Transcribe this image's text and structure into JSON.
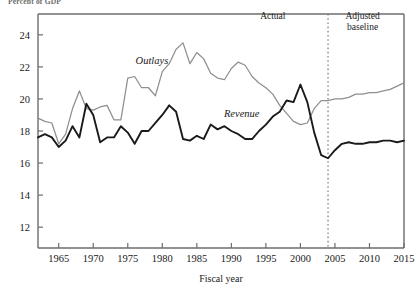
{
  "figure": {
    "supertitle": "Percent of GDP"
  },
  "chart_data": {
    "type": "line",
    "title": "Percent of GDP",
    "xlabel": "Fiscal year",
    "ylabel": "",
    "xlim": [
      1962,
      2015
    ],
    "ylim": [
      10.7,
      25.3
    ],
    "grid": false,
    "legend_position": "inline-annotation",
    "xticks": [
      1965,
      1970,
      1975,
      1980,
      1985,
      1990,
      1995,
      2000,
      2005,
      2010,
      2015
    ],
    "yticks": [
      12,
      14,
      16,
      18,
      20,
      22,
      24
    ],
    "annotations": [
      {
        "name": "actual-label",
        "text": "Actual",
        "x": 1996,
        "y": 25.0
      },
      {
        "name": "adjusted-baseline-label",
        "text": "Adjusted baseline",
        "x": 2009,
        "y": 25.0
      },
      {
        "name": "outlays-inline-label",
        "text": "Outlays",
        "x": 1978.5,
        "y": 22.2
      },
      {
        "name": "revenue-inline-label",
        "text": "Revenue",
        "x": 1991.5,
        "y": 18.9
      }
    ],
    "divider": {
      "name": "projection-divider",
      "x": 2004,
      "style": "dotted"
    },
    "colors": {
      "outlays": "#8f8f8f",
      "revenue": "#1a1a1a",
      "axis": "#6d6d6d",
      "divider": "#7a7a7a"
    },
    "x": [
      1962,
      1963,
      1964,
      1965,
      1966,
      1967,
      1968,
      1969,
      1970,
      1971,
      1972,
      1973,
      1974,
      1975,
      1976,
      1977,
      1978,
      1979,
      1980,
      1981,
      1982,
      1983,
      1984,
      1985,
      1986,
      1987,
      1988,
      1989,
      1990,
      1991,
      1992,
      1993,
      1994,
      1995,
      1996,
      1997,
      1998,
      1999,
      2000,
      2001,
      2002,
      2003,
      2004,
      2005,
      2006,
      2007,
      2008,
      2009,
      2010,
      2011,
      2012,
      2013,
      2014,
      2015
    ],
    "series": [
      {
        "name": "Outlays",
        "color": "#8f8f8f",
        "values": [
          18.8,
          18.6,
          18.5,
          17.2,
          17.8,
          19.4,
          20.5,
          19.4,
          19.3,
          19.5,
          19.6,
          18.7,
          18.7,
          21.3,
          21.4,
          20.7,
          20.7,
          20.2,
          21.7,
          22.2,
          23.1,
          23.5,
          22.2,
          22.9,
          22.5,
          21.6,
          21.3,
          21.2,
          21.9,
          22.3,
          22.1,
          21.4,
          21.0,
          20.7,
          20.3,
          19.6,
          19.1,
          18.6,
          18.4,
          18.5,
          19.4,
          19.9,
          19.9,
          20.0,
          20.0,
          20.1,
          20.3,
          20.3,
          20.4,
          20.4,
          20.5,
          20.6,
          20.8,
          21.0
        ]
      },
      {
        "name": "Revenue",
        "color": "#1a1a1a",
        "values": [
          17.6,
          17.8,
          17.6,
          17.0,
          17.4,
          18.3,
          17.6,
          19.7,
          19.0,
          17.3,
          17.6,
          17.6,
          18.3,
          17.9,
          17.2,
          18.0,
          18.0,
          18.5,
          19.0,
          19.6,
          19.2,
          17.5,
          17.4,
          17.7,
          17.5,
          18.4,
          18.1,
          18.3,
          18.0,
          17.8,
          17.5,
          17.5,
          18.0,
          18.4,
          18.9,
          19.2,
          19.9,
          19.8,
          20.9,
          19.8,
          17.9,
          16.5,
          16.3,
          16.8,
          17.2,
          17.3,
          17.2,
          17.2,
          17.3,
          17.3,
          17.4,
          17.4,
          17.3,
          17.4
        ]
      }
    ]
  },
  "axes": {
    "x_axis_title": "Fiscal year"
  }
}
